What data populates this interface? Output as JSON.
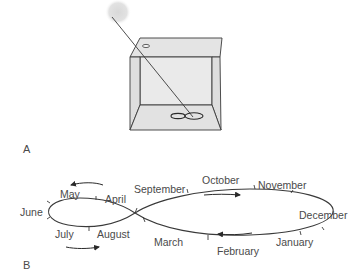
{
  "figure": {
    "part_a": {
      "label": "A",
      "description": "Box with a pinhole in its top; a ray from the sun passes through the hole and traces a figure-eight (analemma) on the floor"
    },
    "part_b": {
      "label": "B",
      "description": "Analemma figure-eight with month positions and direction arrows"
    },
    "months": {
      "june": "June",
      "may": "May",
      "april": "April",
      "july": "July",
      "august": "August",
      "september": "September",
      "october": "October",
      "november": "November",
      "december": "December",
      "january": "January",
      "february": "February",
      "march": "March"
    },
    "colors": {
      "line": "#3a3a3a",
      "box_fill": "#e6e6e6",
      "sun": "#dcdcdc",
      "text": "#4a4a4a"
    }
  }
}
